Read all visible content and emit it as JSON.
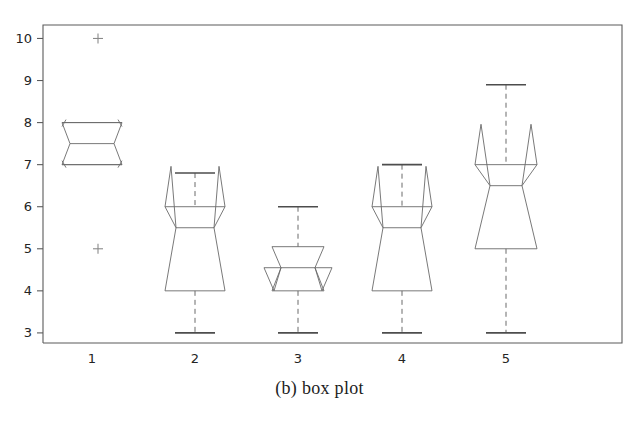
{
  "figure": {
    "caption": "(b) box plot",
    "background_color": "#ffffff",
    "line_color": "#6a6a6a",
    "frame_color": "#5b5b5b",
    "label_color": "#242424"
  },
  "chart_data": {
    "type": "box",
    "title": "",
    "xlabel": "",
    "ylabel": "",
    "categories": [
      "1",
      "2",
      "3",
      "4",
      "5"
    ],
    "xtick_labels": [
      "1",
      "2",
      "3",
      "4",
      "5"
    ],
    "ytick_labels": [
      "3",
      "4",
      "5",
      "6",
      "7",
      "8",
      "9",
      "10"
    ],
    "yticks": [
      3,
      4,
      5,
      6,
      7,
      8,
      9,
      10
    ],
    "ylim": [
      2.76,
      10.3
    ],
    "grid": false,
    "legend": null,
    "notched": true,
    "boxes": [
      {
        "category": "1",
        "lower_whisker": 7.0,
        "q1": 7.0,
        "median": 7.5,
        "q3": 8.0,
        "upper_whisker": 8.0,
        "notch_low": 7.5,
        "notch_high": 7.5,
        "outliers": [
          10.0,
          5.0
        ],
        "whisker_visible": false
      },
      {
        "category": "2",
        "lower_whisker": 3.0,
        "q1": 4.0,
        "median": 5.5,
        "q3": 6.0,
        "upper_whisker": 6.8,
        "notch_low": 5.5,
        "notch_high": 5.5,
        "outliers": [],
        "whisker_visible": true
      },
      {
        "category": "3",
        "lower_whisker": 3.0,
        "q1": 4.0,
        "median": 4.55,
        "q3": 5.05,
        "upper_whisker": 6.0,
        "notch_low": 4.55,
        "notch_high": 4.55,
        "outliers": [],
        "whisker_visible": true
      },
      {
        "category": "4",
        "lower_whisker": 3.0,
        "q1": 4.0,
        "median": 5.5,
        "q3": 6.0,
        "upper_whisker": 7.0,
        "notch_low": 5.5,
        "notch_high": 5.5,
        "outliers": [],
        "whisker_visible": true
      },
      {
        "category": "5",
        "lower_whisker": 3.0,
        "q1": 5.0,
        "median": 6.5,
        "q3": 7.0,
        "upper_whisker": 8.9,
        "notch_low": 6.5,
        "notch_high": 6.5,
        "outliers": [],
        "whisker_visible": true
      }
    ],
    "notch_shape": [
      {
        "category": "1",
        "box_half_width": 30,
        "notch_half_width": 22,
        "flare_half_width": 30,
        "flare_offset": 0.48,
        "upper_cap_style": "angled",
        "lower_cap_style": "angled"
      },
      {
        "category": "2",
        "box_half_width": 30,
        "notch_half_width": 19,
        "flare_half_width": 30,
        "flare_offset": 0.0,
        "upper_cap_style": "peak",
        "lower_cap_style": "flat"
      },
      {
        "category": "3",
        "box_half_width": 26,
        "notch_half_width": 17,
        "flare_half_width": 34,
        "flare_offset": 0.55,
        "upper_cap_style": "flat",
        "lower_cap_style": "flare"
      },
      {
        "category": "4",
        "box_half_width": 30,
        "notch_half_width": 19,
        "flare_half_width": 30,
        "flare_offset": 0.0,
        "upper_cap_style": "peak",
        "lower_cap_style": "flat"
      },
      {
        "category": "5",
        "box_half_width": 31,
        "notch_half_width": 16,
        "flare_half_width": 31,
        "flare_offset": 0.0,
        "upper_cap_style": "peak",
        "lower_cap_style": "flat"
      }
    ]
  },
  "layout": {
    "plot_left": 43,
    "plot_right": 622,
    "plot_top": 25,
    "plot_bottom": 343,
    "y_value_top": 10.32,
    "y_value_bottom": 2.76,
    "category_x": [
      92,
      195,
      298,
      402,
      506
    ]
  }
}
